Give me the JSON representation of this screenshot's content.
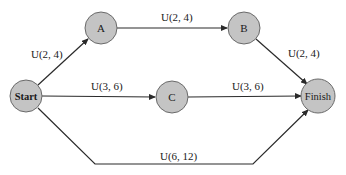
{
  "nodes": {
    "start": {
      "label": "Start"
    },
    "a": {
      "label": "A"
    },
    "b": {
      "label": "B"
    },
    "c": {
      "label": "C"
    },
    "finish": {
      "label": "Finish"
    }
  },
  "edges": {
    "start_a": {
      "label": "U(2, 4)"
    },
    "a_b": {
      "label": "U(2, 4)"
    },
    "b_finish": {
      "label": "U(2, 4)"
    },
    "start_c": {
      "label": "U(3, 6)"
    },
    "c_finish": {
      "label": "U(3, 6)"
    },
    "start_finish": {
      "label": "U(6, 12)"
    }
  },
  "colors": {
    "node_fill": "#c4c4c4",
    "node_stroke": "#6a6a6a",
    "edge": "#2a2a2a"
  }
}
